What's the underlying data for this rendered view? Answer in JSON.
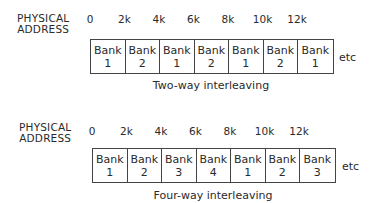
{
  "diagrams": [
    {
      "label_line1": "PHYSICAL",
      "label_line2": "ADDRESS",
      "ticks": [
        "0",
        "2k",
        "4k",
        "6k",
        "8k",
        "10k",
        "12k"
      ],
      "banks": [
        {
          "word": "Bank",
          "num": "1"
        },
        {
          "word": "Bank",
          "num": "2"
        },
        {
          "word": "Bank",
          "num": "1"
        },
        {
          "word": "Bank",
          "num": "2"
        },
        {
          "word": "Bank",
          "num": "1"
        },
        {
          "word": "Bank",
          "num": "2"
        },
        {
          "word": "Bank",
          "num": "1"
        }
      ],
      "etc": "etc",
      "caption": "Two-way interleaving"
    },
    {
      "label_line1": "PHYSICAL",
      "label_line2": "ADDRESS",
      "ticks": [
        "0",
        "2k",
        "4k",
        "6k",
        "8k",
        "10k",
        "12k"
      ],
      "banks": [
        {
          "word": "Bank",
          "num": "1"
        },
        {
          "word": "Bank",
          "num": "2"
        },
        {
          "word": "Bank",
          "num": "3"
        },
        {
          "word": "Bank",
          "num": "4"
        },
        {
          "word": "Bank",
          "num": "1"
        },
        {
          "word": "Bank",
          "num": "2"
        },
        {
          "word": "Bank",
          "num": "3"
        }
      ],
      "etc": "etc",
      "caption": "Four-way interleaving"
    }
  ]
}
